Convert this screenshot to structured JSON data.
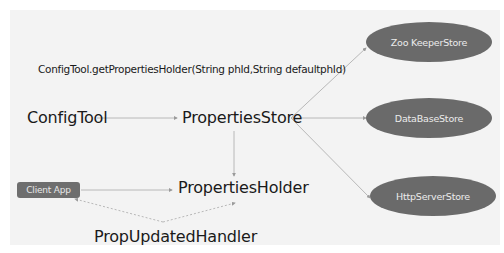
{
  "diagram": {
    "method_caption": "ConfigTool.getPropertiesHolder(String phId,String defaultphId)",
    "nodes": {
      "config_tool": "ConfigTool",
      "properties_store": "PropertiesStore",
      "properties_holder": "PropertiesHolder",
      "prop_updated_handler": "PropUpdatedHandler",
      "client_app": "Client App",
      "zookeeper_store": "Zoo KeeperStore",
      "database_store": "DataBaseStore",
      "httpserver_store": "HttpServerStore"
    },
    "edges": [
      {
        "from": "ConfigTool",
        "to": "PropertiesStore",
        "style": "solid"
      },
      {
        "from": "PropertiesStore",
        "to": "Zoo KeeperStore",
        "style": "solid"
      },
      {
        "from": "PropertiesStore",
        "to": "DataBaseStore",
        "style": "solid"
      },
      {
        "from": "PropertiesStore",
        "to": "HttpServerStore",
        "style": "solid"
      },
      {
        "from": "PropertiesStore",
        "to": "PropertiesHolder",
        "style": "solid"
      },
      {
        "from": "Client App",
        "to": "PropertiesHolder",
        "style": "solid"
      },
      {
        "from": "PropUpdatedHandler",
        "to": "Client App",
        "style": "dashed"
      },
      {
        "from": "PropUpdatedHandler",
        "to": "PropertiesHolder",
        "style": "dashed"
      }
    ],
    "colors": {
      "background": "#f3f3f3",
      "node_fill": "#6a6a6a",
      "node_text": "#ececec",
      "line": "#a8a8a8"
    }
  }
}
